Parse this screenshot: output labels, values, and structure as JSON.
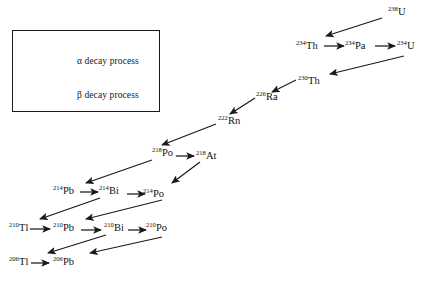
{
  "diagram": {
    "background_color": "#ffffff",
    "stroke_color": "#1a1a1a"
  },
  "legend": {
    "box_border_color": "#1a1a1a",
    "items": [
      {
        "id": "alpha",
        "symbol": "α",
        "label": "α decay process",
        "arrow_style": "diagonal-down-left"
      },
      {
        "id": "beta",
        "symbol": "β",
        "label": "β decay process",
        "arrow_style": "horizontal-right"
      }
    ]
  },
  "nuclides": [
    {
      "id": "u238",
      "mass": "238",
      "element": "U",
      "x": 388,
      "y": 7,
      "label": "238U"
    },
    {
      "id": "th234",
      "mass": "234",
      "element": "Th",
      "x": 296,
      "y": 41,
      "label": "234Th"
    },
    {
      "id": "pa234",
      "mass": "234",
      "element": "Pa",
      "x": 345,
      "y": 41,
      "label": "234Pa"
    },
    {
      "id": "u234",
      "mass": "234",
      "element": "U",
      "x": 397,
      "y": 41,
      "label": "234U"
    },
    {
      "id": "th230",
      "mass": "230",
      "element": "Th",
      "x": 298,
      "y": 76,
      "label": "230Th"
    },
    {
      "id": "ra226",
      "mass": "226",
      "element": "Ra",
      "x": 256,
      "y": 92,
      "label": "226Ra"
    },
    {
      "id": "rn222",
      "mass": "222",
      "element": "Rn",
      "x": 218,
      "y": 116,
      "label": "222Rn"
    },
    {
      "id": "po218",
      "mass": "218",
      "element": "Po",
      "x": 152,
      "y": 148,
      "label": "218Po"
    },
    {
      "id": "at218",
      "mass": "218",
      "element": "At",
      "x": 196,
      "y": 151,
      "label": "218At"
    },
    {
      "id": "pb214",
      "mass": "214",
      "element": "Pb",
      "x": 53,
      "y": 186,
      "label": "214Pb"
    },
    {
      "id": "bi214",
      "mass": "214",
      "element": "Bi",
      "x": 99,
      "y": 186,
      "label": "214Bi"
    },
    {
      "id": "po214",
      "mass": "214",
      "element": "Po",
      "x": 143,
      "y": 189,
      "label": "214Po"
    },
    {
      "id": "tl210",
      "mass": "210",
      "element": "Tl",
      "x": 9,
      "y": 223,
      "label": "210Tl"
    },
    {
      "id": "pb210",
      "mass": "210",
      "element": "Pb",
      "x": 53,
      "y": 223,
      "label": "210Pb"
    },
    {
      "id": "bi210",
      "mass": "210",
      "element": "Bi",
      "x": 104,
      "y": 223,
      "label": "210Bi"
    },
    {
      "id": "po210",
      "mass": "210",
      "element": "Po",
      "x": 146,
      "y": 223,
      "label": "210Po"
    },
    {
      "id": "tl206",
      "mass": "206",
      "element": "Tl",
      "x": 9,
      "y": 257,
      "label": "206Tl"
    },
    {
      "id": "pb206",
      "mass": "206",
      "element": "Pb",
      "x": 53,
      "y": 257,
      "label": "206Pb"
    }
  ],
  "decays": [
    {
      "from": "u238",
      "to": "th234",
      "type": "alpha",
      "x1": 382,
      "y1": 18,
      "x2": 326,
      "y2": 36
    },
    {
      "from": "th234",
      "to": "pa234",
      "type": "beta",
      "x1": 324,
      "y1": 46,
      "x2": 344,
      "y2": 46
    },
    {
      "from": "pa234",
      "to": "u234",
      "type": "beta",
      "x1": 375,
      "y1": 46,
      "x2": 395,
      "y2": 46
    },
    {
      "from": "u234",
      "to": "th230",
      "type": "alpha",
      "x1": 404,
      "y1": 56,
      "x2": 330,
      "y2": 74
    },
    {
      "from": "th230",
      "to": "ra226",
      "type": "alpha",
      "x1": 296,
      "y1": 80,
      "x2": 272,
      "y2": 92
    },
    {
      "from": "ra226",
      "to": "rn222",
      "type": "alpha",
      "x1": 255,
      "y1": 98,
      "x2": 230,
      "y2": 114
    },
    {
      "from": "rn222",
      "to": "po218",
      "type": "alpha",
      "x1": 216,
      "y1": 124,
      "x2": 162,
      "y2": 145
    },
    {
      "from": "po218",
      "to": "at218",
      "type": "beta",
      "x1": 176,
      "y1": 156,
      "x2": 194,
      "y2": 156
    },
    {
      "from": "po218",
      "to": "pb214",
      "type": "alpha",
      "x1": 152,
      "y1": 160,
      "x2": 86,
      "y2": 183
    },
    {
      "from": "at218",
      "to": "po214",
      "type": "alpha",
      "x1": 200,
      "y1": 162,
      "x2": 172,
      "y2": 183
    },
    {
      "from": "pb214",
      "to": "bi214",
      "type": "beta",
      "x1": 80,
      "y1": 192,
      "x2": 98,
      "y2": 192
    },
    {
      "from": "bi214",
      "to": "po214",
      "type": "beta",
      "x1": 127,
      "y1": 194,
      "x2": 145,
      "y2": 194
    },
    {
      "from": "bi214",
      "to": "tl210",
      "type": "alpha",
      "x1": 100,
      "y1": 198,
      "x2": 40,
      "y2": 219
    },
    {
      "from": "po214",
      "to": "pb210",
      "type": "alpha",
      "x1": 162,
      "y1": 200,
      "x2": 86,
      "y2": 219
    },
    {
      "from": "tl210",
      "to": "pb210",
      "type": "beta",
      "x1": 30,
      "y1": 229,
      "x2": 50,
      "y2": 229
    },
    {
      "from": "pb210",
      "to": "bi210",
      "type": "beta",
      "x1": 81,
      "y1": 230,
      "x2": 101,
      "y2": 230
    },
    {
      "from": "bi210",
      "to": "po210",
      "type": "beta",
      "x1": 128,
      "y1": 230,
      "x2": 146,
      "y2": 230
    },
    {
      "from": "bi210",
      "to": "tl206",
      "type": "alpha",
      "x1": 106,
      "y1": 235,
      "x2": 48,
      "y2": 253
    },
    {
      "from": "po210",
      "to": "pb206",
      "type": "alpha",
      "x1": 162,
      "y1": 237,
      "x2": 90,
      "y2": 253
    },
    {
      "from": "tl206",
      "to": "pb206",
      "type": "beta",
      "x1": 31,
      "y1": 263,
      "x2": 49,
      "y2": 263
    }
  ],
  "legend_arrows": [
    {
      "id": "alpha-arrow",
      "x1": 97,
      "y1": 48,
      "x2": 29,
      "y2": 66
    },
    {
      "id": "beta-arrow",
      "x1": 27,
      "y1": 97,
      "x2": 58,
      "y2": 97
    }
  ],
  "legend_text_positions": [
    {
      "id": "alpha",
      "x": 77,
      "y": 56
    },
    {
      "id": "beta",
      "x": 77,
      "y": 90
    }
  ]
}
